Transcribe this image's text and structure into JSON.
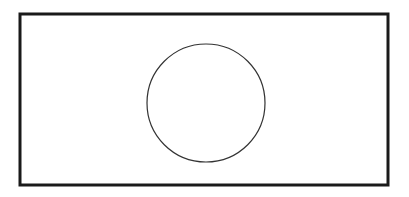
{
  "diagram": {
    "canvas": {
      "width": 409,
      "height": 197,
      "background": "#ffffff"
    },
    "shapes": [
      {
        "type": "rectangle",
        "name": "outer-frame",
        "x": 20,
        "y": 14,
        "width": 368,
        "height": 171,
        "stroke": "#1a1a1a",
        "stroke_width": 3,
        "fill": "none"
      },
      {
        "type": "circle",
        "name": "center-circle",
        "cx": 206,
        "cy": 103,
        "r": 59,
        "stroke": "#333333",
        "stroke_width": 1.2,
        "fill": "none"
      }
    ]
  }
}
